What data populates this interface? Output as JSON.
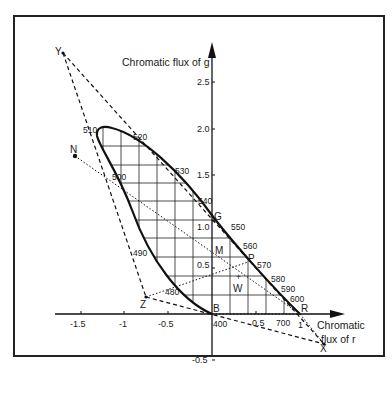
{
  "figure": {
    "kind": "rg chromaticity diagram (CIE 1931 RGB) with spectrum locus and XYZ primaries triangle",
    "y_axis_label": "Chromatic flux of g",
    "x_axis_label_line1": "Chromatic",
    "x_axis_label_line2": "flux of r",
    "x_ticks": [
      {
        "value": -1.5,
        "label": "-1.5"
      },
      {
        "value": -1.0,
        "label": "-1"
      },
      {
        "value": -0.5,
        "label": "-0.5"
      },
      {
        "value": 0.5,
        "label": "0.5"
      }
    ],
    "y_ticks": [
      {
        "value": 2.5,
        "label": "2.5"
      },
      {
        "value": 2.0,
        "label": "2.0"
      },
      {
        "value": 1.5,
        "label": "1.5"
      },
      {
        "value": 1.0,
        "label": "1.0"
      },
      {
        "value": 0.5,
        "label": "0.5"
      },
      {
        "value": -0.5,
        "label": "-0.5"
      }
    ],
    "wavelength_labels": [
      {
        "nm": "400",
        "r": 0.0,
        "g": 0.0
      },
      {
        "nm": "480",
        "r": -0.6,
        "g": 0.33
      },
      {
        "nm": "490",
        "r": -0.95,
        "g": 0.85
      },
      {
        "nm": "500",
        "r": -1.17,
        "g": 1.45
      },
      {
        "nm": "510",
        "r": -1.3,
        "g": 1.95
      },
      {
        "nm": "520",
        "r": -0.8,
        "g": 1.95
      },
      {
        "nm": "530",
        "r": -0.35,
        "g": 1.45
      },
      {
        "nm": "540",
        "r": -0.05,
        "g": 1.2
      },
      {
        "nm": "550",
        "r": 0.15,
        "g": 0.9
      },
      {
        "nm": "560",
        "r": 0.35,
        "g": 0.7
      },
      {
        "nm": "570",
        "r": 0.45,
        "g": 0.55
      },
      {
        "nm": "580",
        "r": 0.6,
        "g": 0.4
      },
      {
        "nm": "590",
        "r": 0.75,
        "g": 0.3
      },
      {
        "nm": "600",
        "r": 0.85,
        "g": 0.2
      },
      {
        "nm": "700",
        "r": 0.82,
        "g": -0.08
      }
    ],
    "points": [
      {
        "name": "Y",
        "label": "Y",
        "r": -1.7,
        "g": 2.75
      },
      {
        "name": "N",
        "label": "N",
        "r": -1.57,
        "g": 1.69
      },
      {
        "name": "Z",
        "label": "Z",
        "r": -0.76,
        "g": 0.18
      },
      {
        "name": "X",
        "label": "X",
        "r": 1.29,
        "g": -0.33
      },
      {
        "name": "B",
        "label": "B",
        "r": 0.0,
        "g": 0.0
      },
      {
        "name": "R",
        "label": "R",
        "r": 1.0,
        "g": 0.0
      },
      {
        "name": "G",
        "label": "G",
        "r": 0.0,
        "g": 1.0
      },
      {
        "name": "M",
        "label": "M",
        "r": 0.0,
        "g": 0.66
      },
      {
        "name": "P",
        "label": "P",
        "r": 0.4,
        "g": 0.56
      },
      {
        "name": "W",
        "label": "W",
        "r": 0.29,
        "g": 0.33
      }
    ],
    "r_axis_extra_label": "1",
    "colors": {
      "ink": "#1a1a1a",
      "background": "#ffffff",
      "frame": "#222222"
    }
  }
}
